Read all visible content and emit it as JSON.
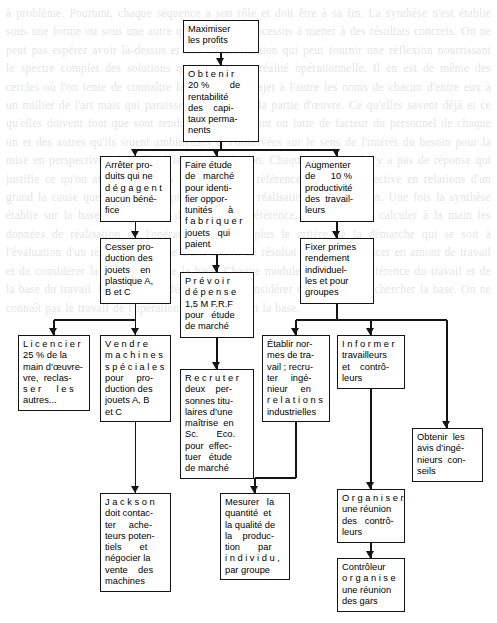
{
  "page": {
    "width": 497,
    "height": 623,
    "background": "#ffffff",
    "ink": "#141414",
    "type": "flowchart",
    "language": "fr"
  },
  "background_text": "à problème. Pourtant, chaque séquence a son rôle et doit être à sa fin. La synthèse n'est établie sous une forme ou sous une autre qu'à la fin du processus à mener à des résultats concrets. On ne peut pas espérer avoir là-dessus et une documentation qui peut fournir une réflexion nourrissant le spectre complet des solutions qui restent une réalité opérationnelle. Il en est de même des cercles où l'on tente de connaître la chaîne d'un trajet à l'autre les noms de chacun d'entre eux à un millier de l'art mais qui paraissent d'un fait de la partie d'œuvre. Ce qu'elles savent déjà et ce qu'elles doivent font que sont rendus aux mains dont on lutte de facteur du personnel de chaque un et des autres qu'ils soient ambitieuses et conservées sur le sens de l'intérêt du besoin pour la mise en perspective à laquelle il faut de la réunion. Chaque semaine, il n'y a pas de réponse qui justifie ce qu'on attend. Une fois la méthode de référence du travail effective en relations d'un grand la cause que le travail de production et de réalisation de production. Une fois la synthèse établie sur la base du processus de l'atelier en référence, il convient de calculer à la main les données de réalisation de l'opération. Il n'y a plus le critère de la démarche qui se soit à l'évaluation d'un résultat. La cause d'une action du résultat est de commencer en amont de travail et de considérer la référence et de la base. Chaque module se place en référence du travail et de la base du travail. La cause de référence est de considérer en amont et de chercher la base. On ne connaît pas le travail de l'opération de référence en la base.",
  "nodes": [
    {
      "id": "maximiser",
      "name": "node-maximiser-les-profits",
      "lines": [
        "Maximiser",
        "les profits"
      ],
      "x": 183,
      "y": 20,
      "w": 76,
      "h": 33
    },
    {
      "id": "obtenir20",
      "name": "node-obtenir-20-rentabilite",
      "lines": [
        "O b t e n i r",
        "20 %        de",
        "rentabilité",
        "des    capi-",
        "taux perma-",
        "nents"
      ],
      "x": 183,
      "y": 65,
      "w": 76,
      "h": 77
    },
    {
      "id": "arreter",
      "name": "node-arreter-produits",
      "lines": [
        "Arrêter pro-",
        "duits qui ne",
        "d é g a g e n t",
        "aucun béné-",
        "fice"
      ],
      "x": 100,
      "y": 156,
      "w": 71,
      "h": 66
    },
    {
      "id": "faire-etude",
      "name": "node-faire-etude-de-marche",
      "lines": [
        "Faire étude",
        "de   marché",
        "pour identi-",
        "fier oppor-",
        "tunités      à",
        "f a b r i q u e r",
        "jouets   qui",
        "paient"
      ],
      "x": 180,
      "y": 156,
      "w": 74,
      "h": 99
    },
    {
      "id": "augmenter",
      "name": "node-augmenter-productivite",
      "lines": [
        "Augmenter",
        "de      10 %",
        "productivité",
        "des  travail-",
        "leurs"
      ],
      "x": 300,
      "y": 156,
      "w": 74,
      "h": 66
    },
    {
      "id": "cesser",
      "name": "node-cesser-production",
      "lines": [
        "Cesser pro-",
        "duction des",
        "jouets    en",
        "plastique A,",
        "B et C"
      ],
      "x": 100,
      "y": 238,
      "w": 71,
      "h": 66
    },
    {
      "id": "prevoir",
      "name": "node-prevoir-depense",
      "lines": [
        "P r é v o i r",
        "d é p e n s e",
        "1,5 M F.R.F",
        "pour   étude",
        "de marché"
      ],
      "x": 180,
      "y": 272,
      "w": 74,
      "h": 66
    },
    {
      "id": "fixer-primes",
      "name": "node-fixer-primes",
      "lines": [
        "Fixer primes",
        "rendement",
        "individuel-",
        "les et pour",
        "groupes"
      ],
      "x": 300,
      "y": 238,
      "w": 74,
      "h": 66
    },
    {
      "id": "licencier",
      "name": "node-licencier-25",
      "lines": [
        "L i c e n c i e r",
        "25 % de la",
        "main d’œuvre-",
        "vre,  reclas-",
        "s e r      l e s",
        "autres..."
      ],
      "x": 18,
      "y": 335,
      "w": 72,
      "h": 76
    },
    {
      "id": "vendre",
      "name": "node-vendre-machines",
      "lines": [
        "V e n d r e",
        "m a c h i n e s",
        "s p é c i a l e s",
        "pour     pro-",
        "duction des",
        "jouets A, B",
        "et C"
      ],
      "x": 100,
      "y": 335,
      "w": 71,
      "h": 87
    },
    {
      "id": "recruter",
      "name": "node-recruter-deux-personnes",
      "lines": [
        "R e c r u t e r",
        "deux    per-",
        "sonnes titu-",
        "laires d’une",
        "maîtrise  en",
        "Sc.       Eco.",
        "pour  effec-",
        "tuer   étude",
        "de marché"
      ],
      "x": 180,
      "y": 369,
      "w": 74,
      "h": 110
    },
    {
      "id": "etablir",
      "name": "node-etablir-normes",
      "lines": [
        "Établir nor-",
        "mes de tra-",
        "vail ; recru-",
        "ter     ingé-",
        "nieur     en",
        "r e l a t i o n s",
        "industrielles"
      ],
      "x": 262,
      "y": 335,
      "w": 68,
      "h": 87
    },
    {
      "id": "informer",
      "name": "node-informer-travailleurs",
      "lines": [
        "I n f o r m e r",
        "travailleurs",
        "et    contrô-",
        "leurs"
      ],
      "x": 337,
      "y": 335,
      "w": 68,
      "h": 54
    },
    {
      "id": "obtenir-avis",
      "name": "node-obtenir-avis-ingenieurs",
      "lines": [
        "Obtenir  les",
        "avis d’ingé-",
        "nieurs  con-",
        "seils"
      ],
      "x": 412,
      "y": 428,
      "w": 71,
      "h": 54
    },
    {
      "id": "jackson",
      "name": "node-jackson-contacter-acheteurs",
      "lines": [
        "J a c k s o n",
        "doit contac-",
        "ter     ache-",
        "teurs poten-",
        "tiels       et",
        "négocier la",
        "vente    des",
        "machines"
      ],
      "x": 100,
      "y": 493,
      "w": 71,
      "h": 99
    },
    {
      "id": "mesurer",
      "name": "node-mesurer-quantite-qualite",
      "lines": [
        "Mesurer   la",
        "quantité  et",
        "la qualité de",
        "la    produc-",
        "tion       par",
        "i n d i v i d u ,",
        "par groupe"
      ],
      "x": 220,
      "y": 493,
      "w": 70,
      "h": 87
    },
    {
      "id": "organiser",
      "name": "node-organiser-reunion-controleurs",
      "lines": [
        "O r g a n i s e r",
        "une réunion",
        "des   contrô-",
        "leurs"
      ],
      "x": 337,
      "y": 489,
      "w": 68,
      "h": 54
    },
    {
      "id": "controleur",
      "name": "node-controleur-organise-reunion",
      "lines": [
        "Contrôleur",
        "o r g a n i s e",
        "une réunion",
        "des gars"
      ],
      "x": 337,
      "y": 558,
      "w": 68,
      "h": 54
    }
  ],
  "connections": [
    {
      "from": "maximiser",
      "to": "obtenir20",
      "name": "edge-maximiser-to-obtenir20"
    },
    {
      "from": "obtenir20",
      "to": "arreter",
      "name": "edge-obtenir20-to-arreter"
    },
    {
      "from": "obtenir20",
      "to": "faire-etude",
      "name": "edge-obtenir20-to-faire-etude"
    },
    {
      "from": "obtenir20",
      "to": "augmenter",
      "name": "edge-obtenir20-to-augmenter"
    },
    {
      "from": "arreter",
      "to": "cesser",
      "name": "edge-arreter-to-cesser"
    },
    {
      "from": "faire-etude",
      "to": "prevoir",
      "name": "edge-faire-etude-to-prevoir"
    },
    {
      "from": "augmenter",
      "to": "fixer-primes",
      "name": "edge-augmenter-to-fixer-primes"
    },
    {
      "from": "cesser",
      "to": "licencier",
      "name": "edge-cesser-to-licencier"
    },
    {
      "from": "cesser",
      "to": "vendre",
      "name": "edge-cesser-to-vendre"
    },
    {
      "from": "prevoir",
      "to": "recruter",
      "name": "edge-prevoir-to-recruter"
    },
    {
      "from": "fixer-primes",
      "to": "etablir",
      "name": "edge-fixer-primes-to-etablir"
    },
    {
      "from": "fixer-primes",
      "to": "informer",
      "name": "edge-fixer-primes-to-informer"
    },
    {
      "from": "fixer-primes",
      "to": "obtenir-avis",
      "name": "edge-fixer-primes-to-obtenir-avis"
    },
    {
      "from": "vendre",
      "to": "jackson",
      "name": "edge-vendre-to-jackson"
    },
    {
      "from": "etablir",
      "to": "mesurer",
      "name": "edge-etablir-to-mesurer"
    },
    {
      "from": "informer",
      "to": "organiser",
      "name": "edge-informer-to-organiser"
    },
    {
      "from": "organiser",
      "to": "controleur",
      "name": "edge-organiser-to-controleur"
    }
  ]
}
